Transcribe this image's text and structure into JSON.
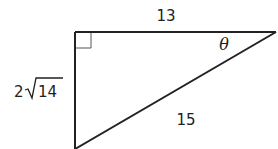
{
  "diagram": {
    "type": "right-triangle",
    "top_side_label": "13",
    "left_side_label_coef": "2",
    "left_side_label_radicand": "14",
    "hypotenuse_label": "15",
    "angle_label": "θ",
    "right_angle_marker": true,
    "colors": {
      "stroke": "#222222",
      "marker": "#555555",
      "background": "#ffffff"
    }
  }
}
